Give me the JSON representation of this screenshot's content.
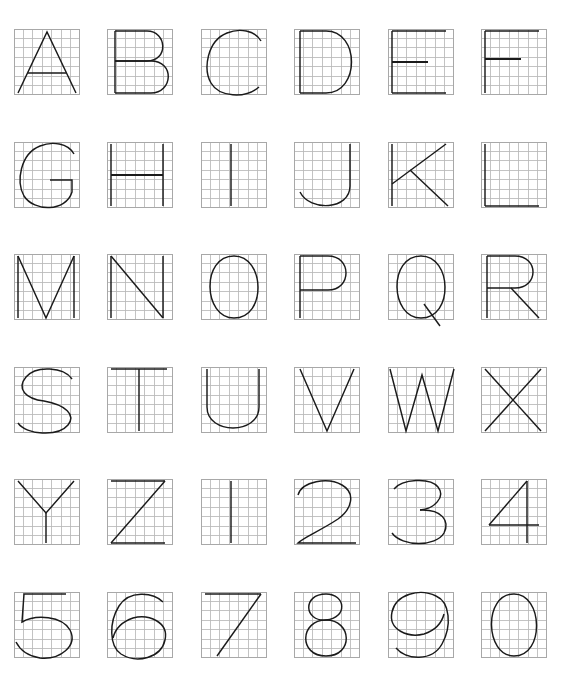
{
  "sheet": {
    "title": "Alphanumeric glyph grid reference sheet",
    "description": "36 glyphs (A-Z and 0-9) each drawn as thin black outlines over a light gray 7x7 graph-paper grid",
    "columns": 6,
    "rows": 6,
    "glyph_count": 36,
    "colors": {
      "background": "#ffffff",
      "grid_line": "#b9b9b9",
      "grid_border": "#a8a8a8",
      "glyph_stroke": "#1a1a1a"
    },
    "grid": {
      "cells_across": 7,
      "cells_down": 7,
      "box_size_px": 66,
      "cell_size_px": 9.43
    }
  },
  "glyphs": [
    {
      "char": "A",
      "name": "glyph-a",
      "row": 1,
      "col": 1,
      "kind": "letter",
      "paths": [
        "M 4 64 L 33 3 L 62 64",
        "M 14 44 L 52 44"
      ]
    },
    {
      "char": "B",
      "name": "glyph-b",
      "row": 1,
      "col": 2,
      "kind": "letter",
      "paths": [
        "M 8 2 L 8 64",
        "M 8 2 L 40 2 C 60 2 62 32 40 32 L 8 32",
        "M 8 32 L 44 32 C 68 32 66 64 44 64 L 8 64"
      ]
    },
    {
      "char": "C",
      "name": "glyph-c",
      "row": 1,
      "col": 3,
      "kind": "letter",
      "paths": [
        "M 60 12 C 54 1 38 -1 26 4 C 6 12 2 40 10 54 C 18 68 44 70 58 58"
      ]
    },
    {
      "char": "D",
      "name": "glyph-d",
      "row": 1,
      "col": 4,
      "kind": "letter",
      "paths": [
        "M 6 2 L 6 64",
        "M 6 2 L 32 2 C 66 2 66 64 32 64 L 6 64"
      ]
    },
    {
      "char": "E",
      "name": "glyph-e",
      "row": 1,
      "col": 5,
      "kind": "letter",
      "paths": [
        "M 4 2 L 4 64",
        "M 4 2 L 58 2",
        "M 4 33 L 40 33",
        "M 4 64 L 58 64"
      ],
      "emphasis": [
        "M 4 33 L 40 33"
      ]
    },
    {
      "char": "F",
      "name": "glyph-f",
      "row": 1,
      "col": 6,
      "kind": "letter",
      "paths": [
        "M 4 2 L 4 64",
        "M 4 2 L 58 2",
        "M 4 30 L 40 30"
      ],
      "emphasis": [
        "M 4 30 L 40 30"
      ]
    },
    {
      "char": "G",
      "name": "glyph-g",
      "row": 2,
      "col": 1,
      "kind": "letter",
      "paths": [
        "M 60 12 C 54 1 38 -1 26 4 C 6 12 2 40 10 54 C 20 70 52 70 58 50 L 58 38 L 36 38"
      ]
    },
    {
      "char": "H",
      "name": "glyph-h",
      "row": 2,
      "col": 2,
      "kind": "letter",
      "paths": [
        "M 4 2 L 4 64",
        "M 56 2 L 56 64",
        "M 4 33 L 56 33"
      ],
      "emphasis": [
        "M 4 33 L 56 33"
      ]
    },
    {
      "char": "I",
      "name": "glyph-i",
      "row": 2,
      "col": 3,
      "kind": "letter",
      "paths": [
        "M 30 2 L 30 64"
      ]
    },
    {
      "char": "J",
      "name": "glyph-j",
      "row": 2,
      "col": 4,
      "kind": "letter",
      "paths": [
        "M 56 2 L 56 44 C 56 68 16 70 6 50"
      ]
    },
    {
      "char": "K",
      "name": "glyph-k",
      "row": 2,
      "col": 5,
      "kind": "letter",
      "paths": [
        "M 4 2 L 4 64",
        "M 4 42 L 58 2",
        "M 22 28 L 60 64"
      ]
    },
    {
      "char": "L",
      "name": "glyph-l",
      "row": 2,
      "col": 6,
      "kind": "letter",
      "paths": [
        "M 4 2 L 4 64",
        "M 4 64 L 58 64"
      ]
    },
    {
      "char": "M",
      "name": "glyph-m",
      "row": 3,
      "col": 1,
      "kind": "letter",
      "paths": [
        "M 4 2 L 4 64",
        "M 4 2 L 32 64 L 60 2",
        "M 60 2 L 60 64"
      ]
    },
    {
      "char": "N",
      "name": "glyph-n",
      "row": 3,
      "col": 2,
      "kind": "letter",
      "paths": [
        "M 4 2 L 4 64",
        "M 4 2 L 56 64",
        "M 56 2 L 56 64"
      ]
    },
    {
      "char": "O",
      "name": "glyph-o",
      "row": 3,
      "col": 3,
      "kind": "letter",
      "paths": [
        "M 33 2 C 64 2 66 64 33 64 C 2 64 0 2 33 2 Z"
      ]
    },
    {
      "char": "P",
      "name": "glyph-p",
      "row": 3,
      "col": 4,
      "kind": "letter",
      "paths": [
        "M 6 2 L 6 64",
        "M 6 2 L 34 2 C 58 2 58 36 34 36 L 6 36"
      ]
    },
    {
      "char": "Q",
      "name": "glyph-q",
      "row": 3,
      "col": 5,
      "kind": "letter",
      "paths": [
        "M 33 2 C 64 2 66 64 33 64 C 2 64 0 2 33 2 Z",
        "M 36 50 L 52 72"
      ]
    },
    {
      "char": "R",
      "name": "glyph-r",
      "row": 3,
      "col": 6,
      "kind": "letter",
      "paths": [
        "M 6 2 L 6 64",
        "M 6 2 L 34 2 C 58 2 58 34 34 34 L 6 34",
        "M 30 34 L 58 64"
      ]
    },
    {
      "char": "S",
      "name": "glyph-s",
      "row": 4,
      "col": 1,
      "kind": "letter",
      "paths": [
        "M 58 12 C 50 0 22 -2 12 10 C 2 22 12 32 30 34 C 52 38 62 48 54 58 C 44 70 12 68 4 56"
      ]
    },
    {
      "char": "T",
      "name": "glyph-t",
      "row": 4,
      "col": 2,
      "kind": "letter",
      "paths": [
        "M 4 2 L 60 2",
        "M 32 2 L 32 64"
      ]
    },
    {
      "char": "U",
      "name": "glyph-u",
      "row": 4,
      "col": 3,
      "kind": "letter",
      "paths": [
        "M 6 2 L 6 40 C 6 68 58 68 58 40 L 58 2"
      ]
    },
    {
      "char": "V",
      "name": "glyph-v",
      "row": 4,
      "col": 4,
      "kind": "letter",
      "paths": [
        "M 6 2 L 33 64 L 60 2"
      ]
    },
    {
      "char": "W",
      "name": "glyph-w",
      "row": 4,
      "col": 5,
      "kind": "letter",
      "paths": [
        "M 2 2 L 18 64 L 34 8 L 50 64 L 66 2"
      ]
    },
    {
      "char": "X",
      "name": "glyph-x",
      "row": 4,
      "col": 6,
      "kind": "letter",
      "paths": [
        "M 4 2 L 60 64",
        "M 60 2 L 4 64"
      ]
    },
    {
      "char": "Y",
      "name": "glyph-y",
      "row": 5,
      "col": 1,
      "kind": "letter",
      "paths": [
        "M 4 2 L 32 34 L 60 2",
        "M 32 34 L 32 64"
      ]
    },
    {
      "char": "Z",
      "name": "glyph-z",
      "row": 5,
      "col": 2,
      "kind": "letter",
      "paths": [
        "M 4 2 L 58 2",
        "M 58 2 L 4 64",
        "M 4 64 L 58 64"
      ]
    },
    {
      "char": "1",
      "name": "glyph-1",
      "row": 5,
      "col": 3,
      "kind": "digit",
      "paths": [
        "M 30 2 L 30 64"
      ]
    },
    {
      "char": "2",
      "name": "glyph-2",
      "row": 5,
      "col": 4,
      "kind": "digit",
      "paths": [
        "M 4 16 C 8 2 34 -2 48 6 C 62 14 58 30 44 40 C 26 52 10 58 4 64 L 62 64"
      ]
    },
    {
      "char": "3",
      "name": "glyph-3",
      "row": 5,
      "col": 5,
      "kind": "digit",
      "paths": [
        "M 6 10 C 14 0 42 -2 50 8 C 58 18 46 30 32 31",
        "M 32 31 C 54 30 62 42 56 54 C 48 68 14 68 4 54"
      ]
    },
    {
      "char": "4",
      "name": "glyph-4",
      "row": 5,
      "col": 6,
      "kind": "digit",
      "paths": [
        "M 46 2 L 8 46",
        "M 8 46 L 58 46",
        "M 46 2 L 46 64"
      ]
    },
    {
      "char": "5",
      "name": "glyph-5",
      "row": 6,
      "col": 1,
      "kind": "digit",
      "paths": [
        "M 52 2 L 10 2 L 8 30 C 22 22 48 24 56 38 C 64 54 46 68 26 66 C 14 64 6 58 2 50"
      ]
    },
    {
      "char": "6",
      "name": "glyph-6",
      "row": 6,
      "col": 2,
      "kind": "digit",
      "paths": [
        "M 56 10 C 46 0 22 -2 12 14 C 2 30 2 54 14 62 C 30 72 54 66 58 48 C 62 30 42 22 26 26 C 14 30 8 38 6 46"
      ]
    },
    {
      "char": "7",
      "name": "glyph-7",
      "row": 6,
      "col": 3,
      "kind": "digit",
      "paths": [
        "M 4 2 L 60 2",
        "M 60 2 L 16 64"
      ]
    },
    {
      "char": "8",
      "name": "glyph-8",
      "row": 6,
      "col": 4,
      "kind": "digit",
      "paths": [
        "M 32 2 C 52 2 54 26 32 28 C 10 30 8 2 32 2 Z",
        "M 32 28 C 58 28 60 64 32 64 C 4 64 6 28 32 28 Z"
      ]
    },
    {
      "char": "9",
      "name": "glyph-9",
      "row": 6,
      "col": 5,
      "kind": "digit",
      "paths": [
        "M 8 56 C 18 68 44 70 54 52 C 64 34 62 10 48 4 C 32 -4 8 2 4 20 C 0 38 20 46 36 42 C 48 38 54 30 56 22"
      ]
    },
    {
      "char": "0",
      "name": "glyph-0",
      "row": 6,
      "col": 6,
      "kind": "digit",
      "paths": [
        "M 33 2 C 62 2 64 64 33 64 C 4 64 2 2 33 2 Z"
      ]
    }
  ]
}
